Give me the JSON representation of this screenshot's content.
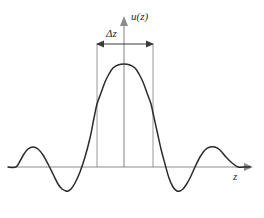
{
  "figure": {
    "name": "sinc-function-with-width-annotation",
    "background_color": "#ffffff",
    "curve_color": "#2b2b2b",
    "axis_color": "#8c8c8c",
    "annotation_color": "#3a3a3a"
  },
  "labels": {
    "y_axis": "u(z)",
    "x_axis": "z",
    "width_marker": "Δz"
  },
  "chart_data": {
    "type": "line",
    "title": "",
    "xlabel": "z",
    "ylabel": "u(z)",
    "grid": false,
    "legend": null,
    "axis_style": "arrow-axes-no-ticks",
    "origin_px": {
      "x": 124,
      "y": 167
    },
    "x_axis_span_px": [
      8,
      252
    ],
    "y_axis_span_px": [
      167,
      18
    ],
    "function": "sinc-like (central lobe plus decaying symmetric side lobes)",
    "annotations": [
      {
        "name": "delta-z-width",
        "text": "Δz",
        "type": "double-arrow-horizontal",
        "y_px": 44,
        "x_start_px": 97,
        "x_end_px": 153,
        "droplines_x_px": [
          97,
          153
        ],
        "droplines_y_from_px": 44,
        "droplines_y_to_px": 167,
        "meaning": "full width of the central lobe between first zero crossings"
      }
    ],
    "x": [
      8,
      16,
      20,
      24,
      28,
      33,
      38,
      43,
      48,
      53,
      58,
      62,
      66,
      68,
      71,
      75,
      80,
      85,
      90,
      94,
      97,
      101,
      105,
      109,
      113,
      118,
      124,
      130,
      135,
      139,
      143,
      147,
      151,
      153,
      157,
      161,
      165,
      169,
      173,
      177,
      180,
      183,
      186,
      190,
      195,
      200,
      205,
      210,
      215,
      220,
      226,
      232,
      238,
      244,
      250
    ],
    "y": [
      167,
      167,
      161,
      154,
      149,
      147,
      149,
      155,
      164,
      174,
      184,
      189,
      191,
      191,
      189,
      183,
      172,
      157,
      138,
      118,
      104,
      93,
      82,
      74,
      68,
      65,
      64,
      65,
      68,
      74,
      82,
      93,
      104,
      113,
      131,
      149,
      164,
      178,
      187,
      191,
      191,
      189,
      185,
      178,
      167,
      157,
      150,
      147,
      147,
      150,
      157,
      163,
      167,
      167,
      167
    ],
    "zero_crossings_px": [
      16,
      97,
      153,
      195,
      244
    ],
    "peaks": [
      {
        "name": "left-outer-lobe",
        "x_px": 33,
        "y_px": 147,
        "relative_amplitude": 0.2
      },
      {
        "name": "central-lobe",
        "x_px": 124,
        "y_px": 64,
        "relative_amplitude": 1.0
      },
      {
        "name": "right-outer-lobe",
        "x_px": 214,
        "y_px": 147,
        "relative_amplitude": 0.2
      }
    ],
    "troughs": [
      {
        "name": "left-negative-lobe",
        "x_px": 68,
        "y_px": 191,
        "relative_amplitude": -0.23
      },
      {
        "name": "right-negative-lobe",
        "x_px": 181,
        "y_px": 191,
        "relative_amplitude": -0.23
      }
    ]
  }
}
